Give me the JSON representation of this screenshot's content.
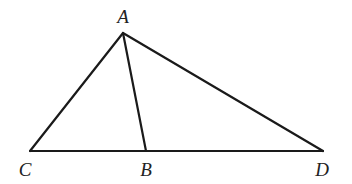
{
  "diagram": {
    "type": "geometry-triangle",
    "stroke_color": "#1a1a1a",
    "background": "#ffffff",
    "points": {
      "A": {
        "label": "A",
        "x": 123,
        "y": 33,
        "label_x": 123,
        "label_y": 23
      },
      "B": {
        "label": "B",
        "x": 146,
        "y": 151,
        "label_x": 146,
        "label_y": 176
      },
      "C": {
        "label": "C",
        "x": 30,
        "y": 151,
        "label_x": 25,
        "label_y": 176
      },
      "D": {
        "label": "D",
        "x": 323,
        "y": 151,
        "label_x": 322,
        "label_y": 176
      }
    },
    "segments": [
      {
        "name": "AC",
        "from": "A",
        "to": "C"
      },
      {
        "name": "AB",
        "from": "A",
        "to": "B"
      },
      {
        "name": "AD",
        "from": "A",
        "to": "D"
      },
      {
        "name": "CD",
        "from": "C",
        "to": "D"
      }
    ]
  }
}
